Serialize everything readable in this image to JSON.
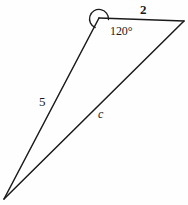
{
  "figure": {
    "type": "geometry-diagram",
    "shape": "triangle",
    "background_color": "#fefefe",
    "stroke_color": "#1a1a1a",
    "stroke_width": 1.4,
    "width": 188,
    "height": 205,
    "vertices": {
      "apex": {
        "name": "apex-vertex",
        "x": 99,
        "y": 18
      },
      "top_right": {
        "name": "top-right-vertex",
        "x": 184,
        "y": 21
      },
      "bottom_left": {
        "name": "bottom-left-vertex",
        "x": 4,
        "y": 199
      }
    },
    "edges": [
      {
        "name": "top-edge",
        "from": "apex",
        "to": "top_right",
        "label": "2"
      },
      {
        "name": "left-edge",
        "from": "apex",
        "to": "bottom_left",
        "label": "5"
      },
      {
        "name": "right-edge",
        "from": "top_right",
        "to": "bottom_left",
        "label": "c"
      }
    ],
    "angle_arc": {
      "name": "angle-arc-120",
      "at_vertex": "apex",
      "path": "M 107.5 19.2 A 9 9 0 1 0 94.6 26.6"
    },
    "labels": {
      "side_top": "2",
      "angle_apex": "120°",
      "side_left": "5",
      "side_right": "c"
    }
  }
}
